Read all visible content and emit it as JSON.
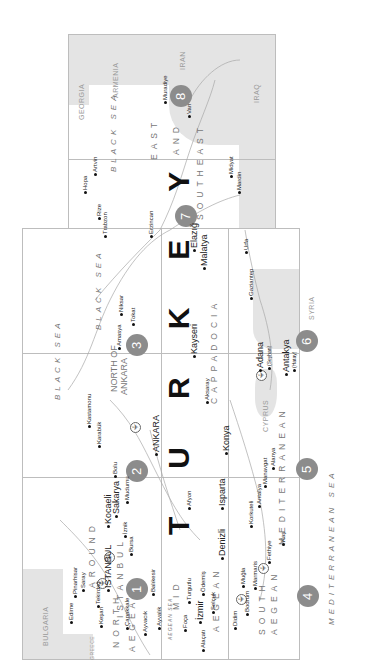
{
  "map": {
    "title": "TURKEY",
    "title_letters": [
      "T",
      "U",
      "R",
      "K",
      "E",
      "Y"
    ],
    "countries": [
      "BULGARIA",
      "GREECE",
      "GEORGIA",
      "ARMENIA",
      "IRAN",
      "IRAQ",
      "SYRIA",
      "CYPRUS"
    ],
    "seas": {
      "black_sea_1": "BLACK SEA",
      "black_sea_2": "BLACK SEA",
      "black_sea_3": "BLACK SEA",
      "mediterranean": "MEDITERRANEAN SEA",
      "aegean": "AEGEAN SEA"
    },
    "regions": [
      {
        "number": "1",
        "name_lines": [
          "AROUND",
          "ISTANBUL"
        ]
      },
      {
        "number": "1",
        "name_lines": [
          "NORTH",
          "AEGEAN"
        ]
      },
      {
        "number": "2",
        "name_lines": [
          "NORTH OF",
          "ANKARA"
        ]
      },
      {
        "number": "3",
        "name_lines": [
          "CAPPADOCIA"
        ]
      },
      {
        "number": "4",
        "name_lines": [
          "SOUTH",
          "AEGEAN"
        ]
      },
      {
        "number": "4",
        "name_lines": [
          "MID",
          "AEGEAN"
        ]
      },
      {
        "number": "5",
        "name_lines": [
          "MEDITERRANEAN"
        ]
      },
      {
        "number": "6",
        "name_lines": []
      },
      {
        "number": "7",
        "name_lines": []
      },
      {
        "number": "8",
        "name_lines": [
          "EAST",
          "AND",
          "SOUTHEAST"
        ]
      }
    ],
    "region_labels": {
      "around": "AROUND",
      "istanbul_region": "ISTANBUL",
      "north": "NORTH",
      "aegean_n": "AEGEAN",
      "north_of": "NORTH OF",
      "ankara_region": "ANKARA",
      "cappadocia": "CAPPADOCIA",
      "mid": "MID",
      "aegean_m": "AEGEAN",
      "south": "SOUTH",
      "aegean_s": "AEGEAN",
      "mediterranean": "MEDITERRANEAN",
      "east": "EAST",
      "and": "AND",
      "southeast": "SOUTHEAST"
    },
    "badges": [
      "1",
      "2",
      "3",
      "4",
      "5",
      "6",
      "7",
      "8"
    ],
    "cities": {
      "istanbul": "ISTANBUL",
      "ankara": "ANKARA",
      "izmir": "İzmir",
      "bursa": "Bursa",
      "edirne": "Edirne",
      "pinarhisar": "Pinarhisar",
      "saray": "Saray",
      "tekirdag": "Tekirdağ",
      "kesan": "Keşan",
      "canakkale": "Çanakkale",
      "ayvacik": "Ayvacık",
      "ayvalik": "Ayvalık",
      "balikesir": "Balıkesir",
      "kocaeli": "Kocaeli",
      "sakarya": "Sakarya",
      "iznik": "İznik",
      "bolu": "Bolu",
      "mudurnu": "Mudurnu",
      "kastamonu": "Kastamonu",
      "safranbolu": "Karabük",
      "amasya": "Amasya",
      "niksar": "Niksar",
      "tokat": "Tokat",
      "kayseri": "Kayseri",
      "aksaray": "Aksaray",
      "konya": "Konya",
      "afyon": "Afyon",
      "isparta": "Isparta",
      "denizli": "Denizli",
      "turgutlu": "Turgutlu",
      "odemis": "Ödemiş",
      "foca": "Foça",
      "selcuk": "Selçuk",
      "alacati": "Alaçatı",
      "didim": "Didim",
      "bodrum": "Bodrum",
      "mugla": "Muğla",
      "marmaris": "Marmaris",
      "fethiye": "Fethiye",
      "kas": "Kaş",
      "korkuteli": "Korkuteli",
      "antalya": "Antalya",
      "manavgat": "Manavgat",
      "alanya": "Alanya",
      "adana": "Adana",
      "adana_sub": "(Seyhan)",
      "antakya": "Antakya",
      "antakya_sub": "(Hatay)",
      "gaziantep": "Gaziantep",
      "hopa": "Hopa",
      "artvin": "Artvin",
      "rize": "Rize",
      "trabzon": "Trabzon",
      "erzincan": "Erzincan",
      "elazig": "Elazığ",
      "malatya": "Malatya",
      "urfa": "Urfa",
      "midyat": "Midyat",
      "mardin": "Mardin",
      "muradiye": "Muradiye",
      "van": "Van"
    },
    "colors": {
      "badge": "#8c8c8c",
      "land_neighbor": "#e4e4e4",
      "border": "#bdbdbd",
      "text": "#222222"
    }
  }
}
